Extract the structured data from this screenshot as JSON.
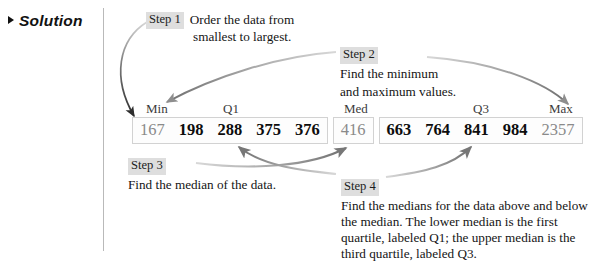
{
  "gutter": {
    "label": "Solution",
    "marker_icon": "triangle-right-icon"
  },
  "steps": [
    {
      "tag": "Step 1",
      "line1": "Order the data from",
      "line2": "smallest to largest.",
      "body": "Order the data from smallest to largest."
    },
    {
      "tag": "Step 2",
      "line1": "Find the minimum",
      "line2": "and maximum values.",
      "body": "Find the minimum and maximum values."
    },
    {
      "tag": "Step 3",
      "line1": "Find the median of the data.",
      "body": "Find the median of the data."
    },
    {
      "tag": "Step 4",
      "body": "Find the medians for the data above and below the median. The lower median is the first quartile, labeled Q1; the upper median is the third quartile, labeled Q3."
    }
  ],
  "dataset": {
    "groups": [
      {
        "name": "lower-half",
        "cells": [
          {
            "value": "167",
            "style": "muted"
          },
          {
            "value": "198",
            "style": "bold"
          },
          {
            "value": "288",
            "style": "bold"
          },
          {
            "value": "375",
            "style": "bold"
          },
          {
            "value": "376",
            "style": "bold"
          }
        ]
      },
      {
        "name": "median",
        "cells": [
          {
            "value": "416",
            "style": "muted"
          }
        ]
      },
      {
        "name": "upper-half",
        "cells": [
          {
            "value": "663",
            "style": "bold"
          },
          {
            "value": "764",
            "style": "bold"
          },
          {
            "value": "841",
            "style": "bold"
          },
          {
            "value": "984",
            "style": "bold"
          },
          {
            "value": "2357",
            "style": "muted"
          }
        ]
      }
    ]
  },
  "markers": {
    "min": "Min",
    "q1": "Q1",
    "med": "Med",
    "q3": "Q3",
    "max": "Max"
  },
  "colors": {
    "arrow_dark": "#2e2e2e",
    "arrow_gray": "#9a9a9a",
    "tag_background": "#dedede",
    "box_border": "#d2d2d2",
    "muted_text": "#8a8a8a",
    "divider": "#b9b9b9"
  }
}
